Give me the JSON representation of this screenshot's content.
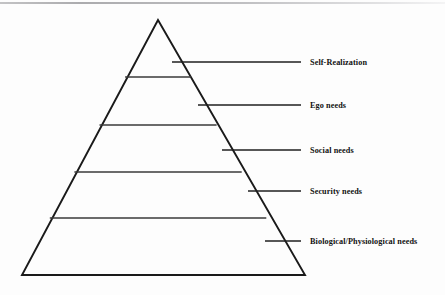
{
  "diagram": {
    "type": "pyramid-hierarchy",
    "background_color": "#fdfdfd",
    "line_color": "#1a1a1a",
    "text_color": "#111111",
    "pyramid": {
      "apex": {
        "x": 158,
        "y": 20
      },
      "base_left": {
        "x": 22,
        "y": 275
      },
      "base_right": {
        "x": 305,
        "y": 275
      },
      "outline_width": 1.9,
      "divider_width": 1.3,
      "dividers_y": [
        77,
        125,
        172,
        218
      ]
    },
    "levels": [
      {
        "index": 1,
        "label": "Self-Realization",
        "position": "top",
        "leader": {
          "x1": 172,
          "x2": 301,
          "y": 62
        },
        "label_y": 57,
        "wrap": false
      },
      {
        "index": 2,
        "label": "Ego needs",
        "position": "second",
        "leader": {
          "x1": 198,
          "x2": 301,
          "y": 105
        },
        "label_y": 100,
        "wrap": false
      },
      {
        "index": 3,
        "label": "Social needs",
        "position": "middle",
        "leader": {
          "x1": 222,
          "x2": 301,
          "y": 150
        },
        "label_y": 145,
        "wrap": false
      },
      {
        "index": 4,
        "label": "Security needs",
        "position": "fourth",
        "leader": {
          "x1": 248,
          "x2": 301,
          "y": 191
        },
        "label_y": 186,
        "wrap": false
      },
      {
        "index": 5,
        "label": "Biological/Physiological needs",
        "position": "base",
        "leader": {
          "x1": 265,
          "x2": 301,
          "y": 241
        },
        "label_y": 236,
        "wrap": true
      }
    ]
  }
}
